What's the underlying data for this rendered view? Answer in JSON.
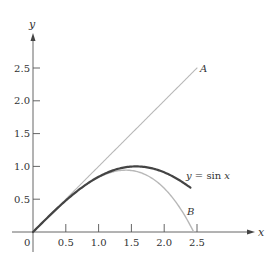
{
  "chart_data": {
    "type": "line",
    "title": "",
    "xlabel": "x",
    "ylabel": "y",
    "xlim": [
      0,
      2.7
    ],
    "ylim": [
      0,
      2.9
    ],
    "grid": false,
    "x_ticks": [
      "0",
      "0.5",
      "1.0",
      "1.5",
      "2.0",
      "2.5"
    ],
    "y_ticks": [
      "0.5",
      "1.0",
      "1.5",
      "2.0",
      "2.5"
    ],
    "series": [
      {
        "name": "A",
        "label": "A",
        "formula": "y = x",
        "color": "#b8b8b8",
        "x": [
          0,
          0.5,
          1.0,
          1.5,
          2.0,
          2.5
        ],
        "values": [
          0,
          0.5,
          1.0,
          1.5,
          2.0,
          2.5
        ]
      },
      {
        "name": "y = sin x",
        "label": "y = sin x",
        "formula": "y = sin x",
        "color": "#444444",
        "x": [
          0,
          0.5,
          1.0,
          1.5,
          2.0,
          2.4
        ],
        "values": [
          0,
          0.479,
          0.841,
          0.997,
          0.909,
          0.675
        ]
      },
      {
        "name": "B",
        "label": "B",
        "formula": "y = x - x^3/6",
        "color": "#b8b8b8",
        "x": [
          0,
          0.5,
          1.0,
          1.5,
          2.0,
          2.45
        ],
        "values": [
          0,
          0.479,
          0.833,
          0.938,
          0.667,
          0.0
        ]
      }
    ],
    "annotations": [
      "A",
      "B",
      "y = sin x"
    ]
  },
  "axes": {
    "x_label": "x",
    "y_label": "y",
    "origin_label": "0"
  },
  "labels": {
    "line_a": "A",
    "line_b": "B",
    "sin_prefix": "y",
    "sin_eq": " = sin ",
    "sin_var": "x"
  }
}
